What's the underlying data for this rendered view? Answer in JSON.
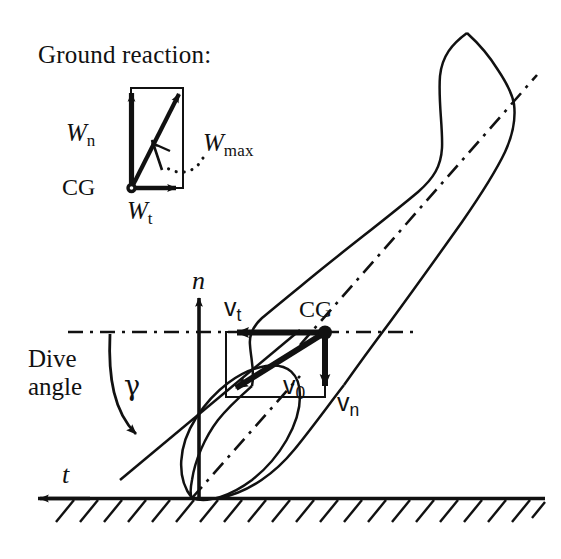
{
  "figure": {
    "domain_note": "Aircraft landing-gear dive-angle and ground-reaction force diagram",
    "background_color": "#ffffff",
    "stroke_color": "#111111",
    "width": 561,
    "height": 559
  },
  "inset": {
    "title": "Ground reaction:",
    "cg_label": "CG",
    "vectors": [
      {
        "name": "W_n",
        "base": "W",
        "sub": "n",
        "direction": "up",
        "label": "W"
      },
      {
        "name": "W_t",
        "base": "W",
        "sub": "t",
        "direction": "right",
        "label": "W"
      },
      {
        "name": "W_max",
        "base": "W",
        "sub": "max",
        "direction": "diagonal-up-right",
        "label": "W"
      }
    ],
    "subscripts": {
      "n": "n",
      "t": "t",
      "max": "max"
    }
  },
  "main": {
    "cg_label": "CG",
    "dive_label_line1": "Dive",
    "dive_label_line2": "angle",
    "angle_symbol": "γ",
    "axis_n": "n",
    "axis_t": "t",
    "velocity_vectors": [
      {
        "name": "v_t",
        "base": "v",
        "sub": "t",
        "direction": "left"
      },
      {
        "name": "v_n",
        "base": "v",
        "sub": "n",
        "direction": "down"
      },
      {
        "name": "v_0",
        "base": "v",
        "sub": "0",
        "direction": "diagonal-down-left"
      }
    ],
    "subscripts": {
      "t": "t",
      "n": "n",
      "zero": "0"
    },
    "v_base": "v"
  }
}
